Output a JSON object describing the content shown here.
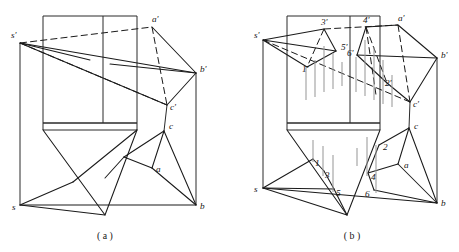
{
  "document": {
    "title": "Descriptive geometry: pyramid and prism intersection projections",
    "background_color": "#ffffff",
    "line_color": "#1a1a1a",
    "hatch_color": "#9a9a9a",
    "width": 459,
    "height": 252
  },
  "figures": [
    {
      "id": "figure-a",
      "caption": "( a )",
      "caption_x": 105,
      "caption_y": 239,
      "description": "Two-view projection of a pyramid s-abc intersecting a vertical prism, before intersection lines are constructed",
      "labels": [
        {
          "name": "s-prime",
          "text": "s'",
          "x": 11,
          "y": 38
        },
        {
          "name": "a-prime",
          "text": "a'",
          "x": 152,
          "y": 22
        },
        {
          "name": "b-prime",
          "text": "b'",
          "x": 200,
          "y": 72
        },
        {
          "name": "c-prime",
          "text": "c'",
          "x": 170,
          "y": 110
        },
        {
          "name": "c",
          "text": "c",
          "x": 169,
          "y": 129
        },
        {
          "name": "a",
          "text": "a",
          "x": 156,
          "y": 172
        },
        {
          "name": "b",
          "text": "b",
          "x": 200,
          "y": 209
        },
        {
          "name": "s",
          "text": "s",
          "x": 12,
          "y": 210
        }
      ],
      "vertices": {
        "s_prime": [
          20,
          43
        ],
        "a_prime": [
          152,
          27
        ],
        "b_prime": [
          196,
          73
        ],
        "c_prime": [
          167,
          105
        ],
        "s": [
          20,
          205
        ],
        "a": [
          152,
          168
        ],
        "b": [
          196,
          205
        ],
        "c": [
          164,
          131
        ]
      },
      "prism": {
        "left": 43,
        "right": 137,
        "top": 16,
        "band_top": 123,
        "band_bottom": 130,
        "inner_vertical": 103,
        "apex": [
          105,
          215
        ]
      }
    },
    {
      "id": "figure-b",
      "caption": "( b )",
      "caption_x": 352,
      "caption_y": 239,
      "description": "Same projection with intersection points 1-6 and 1'-6' constructed and hatching shown",
      "labels": [
        {
          "name": "s-prime",
          "text": "s'",
          "x": 254,
          "y": 38
        },
        {
          "name": "point-3-prime",
          "text": "3'",
          "x": 321,
          "y": 25
        },
        {
          "name": "point-4-prime",
          "text": "4'",
          "x": 363,
          "y": 23
        },
        {
          "name": "a-prime",
          "text": "a'",
          "x": 398,
          "y": 21
        },
        {
          "name": "point-5-prime",
          "text": "5'",
          "x": 341,
          "y": 50
        },
        {
          "name": "point-6-prime",
          "text": "6'",
          "x": 349,
          "y": 56
        },
        {
          "name": "b-prime",
          "text": "b'",
          "x": 441,
          "y": 58
        },
        {
          "name": "point-1-prime",
          "text": "1'",
          "x": 303,
          "y": 72
        },
        {
          "name": "point-2-prime",
          "text": "2'",
          "x": 385,
          "y": 86
        },
        {
          "name": "c-prime",
          "text": "c'",
          "x": 413,
          "y": 107
        },
        {
          "name": "c",
          "text": "c",
          "x": 414,
          "y": 129
        },
        {
          "name": "point-2",
          "text": "2",
          "x": 383,
          "y": 150
        },
        {
          "name": "a",
          "text": "a",
          "x": 404,
          "y": 168
        },
        {
          "name": "point-1",
          "text": "1",
          "x": 315,
          "y": 166
        },
        {
          "name": "point-3",
          "text": "3",
          "x": 325,
          "y": 178
        },
        {
          "name": "point-4",
          "text": "4",
          "x": 371,
          "y": 180
        },
        {
          "name": "point-5",
          "text": "5",
          "x": 336,
          "y": 196
        },
        {
          "name": "point-6",
          "text": "6",
          "x": 365,
          "y": 197
        },
        {
          "name": "s",
          "text": "s",
          "x": 254,
          "y": 192
        },
        {
          "name": "b",
          "text": "b",
          "x": 441,
          "y": 206
        }
      ],
      "vertices": {
        "s_prime": [
          263,
          40
        ],
        "a_prime": [
          398,
          25
        ],
        "b_prime": [
          437,
          58
        ],
        "c_prime": [
          410,
          102
        ],
        "s": [
          263,
          188
        ],
        "a": [
          398,
          164
        ],
        "b": [
          437,
          203
        ],
        "c": [
          409,
          128
        ],
        "p1_prime": [
          307,
          67
        ],
        "p2_prime": [
          387,
          83
        ],
        "p3_prime": [
          324,
          29
        ],
        "p4_prime": [
          366,
          27
        ],
        "p5_prime": [
          336,
          51
        ],
        "p6_prime": [
          357,
          55
        ],
        "p1": [
          313,
          159
        ],
        "p2": [
          379,
          145
        ],
        "p3": [
          324,
          171
        ],
        "p4": [
          368,
          173
        ],
        "p5": [
          334,
          189
        ],
        "p6": [
          374,
          190
        ]
      },
      "prism": {
        "left": 287,
        "right": 380,
        "top": 16,
        "band_top": 123,
        "band_bottom": 130,
        "inner_vertical": 350,
        "apex": [
          347,
          215
        ]
      }
    }
  ]
}
